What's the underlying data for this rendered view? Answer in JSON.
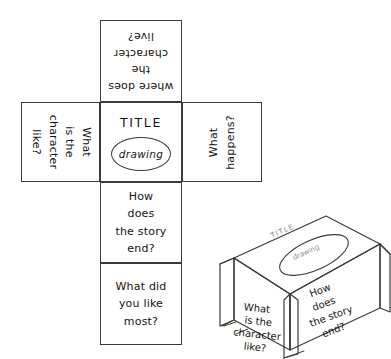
{
  "figure": {
    "name": "story-cube-template",
    "background_color": "#ffffff",
    "ink_color": "#3b3b3b"
  },
  "net": {
    "panels": [
      {
        "id": "live",
        "name": "top-face",
        "text": "where does\nthe\ncharacter\nlive?",
        "orientation": "upside-down"
      },
      {
        "id": "character",
        "name": "left-face",
        "text": "What\nis the\ncharacter\nlike?",
        "orientation": "rotated-90-cw"
      },
      {
        "id": "title",
        "name": "centre-face",
        "title_word": "TITLE",
        "oval_word": "drawing",
        "orientation": "upright"
      },
      {
        "id": "happens",
        "name": "right-face",
        "text": "What\nhappens?",
        "orientation": "rotated-90-ccw"
      },
      {
        "id": "end",
        "name": "lower-face",
        "text": "How\ndoes\nthe story\nend?",
        "orientation": "upright"
      },
      {
        "id": "most",
        "name": "bottom-face",
        "text": "What did\nyou like\nmost?",
        "orientation": "upright"
      }
    ]
  },
  "assembled_box": {
    "name": "folded-cube-illustration",
    "top": {
      "title_word": "TITLE",
      "oval_word": "drawing"
    },
    "left_face": {
      "lines": [
        "What",
        "is the",
        "character",
        "like?"
      ]
    },
    "right_face": {
      "lines": [
        "How",
        "does",
        "the story",
        "end?"
      ]
    }
  }
}
